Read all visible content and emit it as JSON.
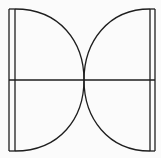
{
  "diagram": {
    "title": "",
    "canvas": {
      "width": 161,
      "height": 158
    },
    "colors": {
      "background": "#fbfbfb",
      "stroke": "#1e1e1e"
    },
    "shapes": {
      "left_outer_line": {
        "x": 9,
        "y1": 9,
        "y2": 151
      },
      "left_diameter": {
        "x": 15,
        "y1": 9,
        "y2": 151
      },
      "right_diameter": {
        "x": 150,
        "y1": 9,
        "y2": 151
      },
      "right_outer_line": {
        "x": 155,
        "y1": 9,
        "y2": 151
      },
      "left_semicircle": {
        "cx": 15,
        "cy": 80,
        "r": 71
      },
      "right_semicircle": {
        "cx": 150,
        "cy": 80,
        "r": 66
      },
      "horizontal_midline": {
        "y": 80,
        "x1": 9,
        "x2": 155
      },
      "top_edge_left": {
        "x1": 9,
        "x2": 15,
        "y": 9
      },
      "bottom_edge_left": {
        "x1": 9,
        "x2": 15,
        "y": 151
      },
      "top_edge_right": {
        "x1": 150,
        "x2": 155,
        "y": 9
      },
      "bottom_edge_right": {
        "x1": 150,
        "x2": 155,
        "y": 151
      }
    },
    "labels": []
  }
}
